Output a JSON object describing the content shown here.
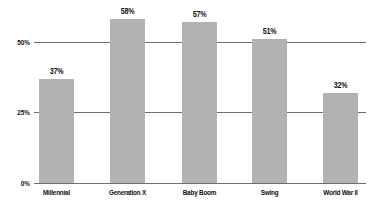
{
  "chart_data": {
    "type": "bar",
    "title": "",
    "subtitle": "",
    "xlabel": "",
    "ylabel": "",
    "categories": [
      "Millennial",
      "Generation X",
      "Baby Boom",
      "Swing",
      "World War II"
    ],
    "values": [
      37,
      58,
      57,
      51,
      32
    ],
    "value_labels": [
      "37%",
      "58%",
      "57%",
      "51%",
      "32%"
    ],
    "ylim": [
      0,
      62
    ],
    "yticks": [
      0,
      25,
      50
    ],
    "ytick_labels": [
      "0%",
      "25%",
      "50%"
    ],
    "grid": "horizontal",
    "gridlines_at": [
      25,
      50
    ],
    "legend": "none",
    "series": [
      {
        "name": "Percent",
        "values": [
          37,
          58,
          57,
          51,
          32
        ]
      }
    ],
    "colors": {
      "bar_fill": "#b2b2b2",
      "gridline": "#6e6e6e",
      "axis_line": "#6e6e6e",
      "text": "#101010",
      "background": "#ffffff"
    }
  }
}
